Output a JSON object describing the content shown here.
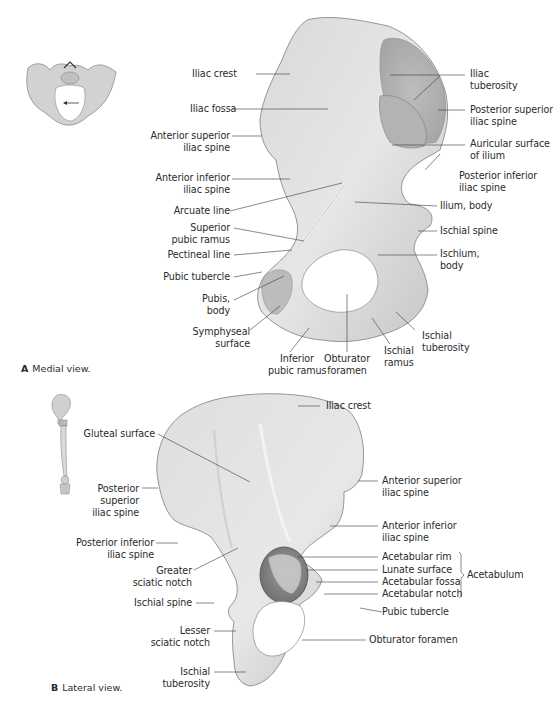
{
  "figure": {
    "panels": [
      {
        "id": "A",
        "letter": "A",
        "caption": "Medial view.",
        "labels": {
          "iliac_crest": "Iliac crest",
          "iliac_fossa": "Iliac fossa",
          "asis_1": "Anterior superior",
          "asis_2": "iliac spine",
          "aiis_1": "Anterior inferior",
          "aiis_2": "iliac spine",
          "arcuate_line": "Arcuate line",
          "sup_pubic_ramus_1": "Superior",
          "sup_pubic_ramus_2": "pubic ramus",
          "pectineal_line": "Pectineal line",
          "pubic_tubercle": "Pubic tubercle",
          "pubis_body_1": "Pubis,",
          "pubis_body_2": "body",
          "symphyseal_1": "Symphyseal",
          "symphyseal_2": "surface",
          "inf_pubic_ramus_1": "Inferior",
          "inf_pubic_ramus_2": "pubic ramus",
          "obturator_1": "Obturator",
          "obturator_2": "foramen",
          "ischial_ramus_1": "Ischial",
          "ischial_ramus_2": "ramus",
          "ischial_tuberosity_1": "Ischial",
          "ischial_tuberosity_2": "tuberosity",
          "ischium_body_1": "Ischium,",
          "ischium_body_2": "body",
          "ischial_spine": "Ischial spine",
          "ilium_body": "Ilium, body",
          "piis_1": "Posterior inferior",
          "piis_2": "iliac spine",
          "auricular_1": "Auricular surface",
          "auricular_2": "of ilium",
          "psis_1": "Posterior superior",
          "psis_2": "iliac spine",
          "iliac_tuberosity_1": "Iliac",
          "iliac_tuberosity_2": "tuberosity"
        }
      },
      {
        "id": "B",
        "letter": "B",
        "caption": "Lateral view.",
        "labels": {
          "iliac_crest": "Iliac crest",
          "gluteal_surface": "Gluteal surface",
          "psis_1": "Posterior",
          "psis_2": "superior",
          "psis_3": "iliac spine",
          "piis_1": "Posterior inferior",
          "piis_2": "iliac spine",
          "greater_sciatic_1": "Greater",
          "greater_sciatic_2": "sciatic notch",
          "ischial_spine": "Ischial spine",
          "lesser_sciatic_1": "Lesser",
          "lesser_sciatic_2": "sciatic notch",
          "ischial_tuberosity_1": "Ischial",
          "ischial_tuberosity_2": "tuberosity",
          "asis_1": "Anterior superior",
          "asis_2": "iliac spine",
          "aiis_1": "Anterior inferior",
          "aiis_2": "iliac spine",
          "acetabular_rim": "Acetabular rim",
          "lunate_surface": "Lunate surface",
          "acetabular_fossa": "Acetabular fossa",
          "acetabular_notch": "Acetabular notch",
          "acetabulum_group": "Acetabulum",
          "pubic_tubercle": "Pubic tubercle",
          "obturator_foramen": "Obturator foramen"
        }
      }
    ]
  },
  "colors": {
    "bone_light": "#e4e4e4",
    "bone_mid": "#cfcfcf",
    "bone_dark": "#9a9a9a",
    "leader": "#3a3a3a",
    "text": "#2b2b2b"
  }
}
